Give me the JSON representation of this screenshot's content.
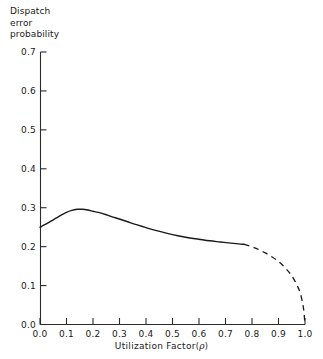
{
  "chart_data": {
    "type": "line",
    "title": "",
    "ylabel": "Dispatch error probability",
    "ylabel_lines": [
      "Dispatch",
      "error",
      "probability"
    ],
    "xlabel": "Utilization Factor (ρ)",
    "xlabel_text": "Utilization  Factor",
    "xlabel_symbol": "ρ",
    "xlabel_paren_open": "(",
    "xlabel_paren_close": ")",
    "xlim": [
      0.0,
      1.0
    ],
    "ylim": [
      0.0,
      0.7
    ],
    "grid": false,
    "legend": null,
    "xticks": [
      0.0,
      0.1,
      0.2,
      0.3,
      0.4,
      0.5,
      0.6,
      0.7,
      0.8,
      0.9,
      1.0
    ],
    "xtick_labels": [
      "0.0",
      "0.1",
      "0.2",
      "0.3",
      "0.4",
      "0.5",
      "0.6",
      "0.7",
      "0.8",
      "0.9",
      "1.0"
    ],
    "yticks": [
      0.0,
      0.1,
      0.2,
      0.3,
      0.4,
      0.5,
      0.6,
      0.7
    ],
    "ytick_labels": [
      "0.0",
      "0.1",
      "0.2",
      "0.3",
      "0.4",
      "0.5",
      "0.6",
      "0.7"
    ],
    "line_color": "#1a1a1a",
    "series": [
      {
        "name": "dispatch-error-probability-solid",
        "style": "solid",
        "x": [
          0.0,
          0.02,
          0.04,
          0.06,
          0.08,
          0.1,
          0.12,
          0.14,
          0.15,
          0.16,
          0.18,
          0.2,
          0.22,
          0.25,
          0.28,
          0.3,
          0.33,
          0.36,
          0.4,
          0.44,
          0.48,
          0.52,
          0.56,
          0.6,
          0.64,
          0.68,
          0.72,
          0.75,
          0.77
        ],
        "y": [
          0.25,
          0.257,
          0.265,
          0.273,
          0.281,
          0.288,
          0.293,
          0.296,
          0.296,
          0.296,
          0.294,
          0.291,
          0.288,
          0.282,
          0.275,
          0.271,
          0.264,
          0.257,
          0.249,
          0.241,
          0.234,
          0.228,
          0.223,
          0.219,
          0.215,
          0.212,
          0.209,
          0.207,
          0.206
        ]
      },
      {
        "name": "dispatch-error-probability-dashed",
        "style": "dashed",
        "x": [
          0.77,
          0.79,
          0.81,
          0.83,
          0.85,
          0.87,
          0.89,
          0.91,
          0.93,
          0.945,
          0.96,
          0.972,
          0.982,
          0.99,
          0.995,
          1.0
        ],
        "y": [
          0.206,
          0.202,
          0.197,
          0.191,
          0.184,
          0.176,
          0.167,
          0.156,
          0.142,
          0.13,
          0.114,
          0.098,
          0.081,
          0.058,
          0.038,
          0.0
        ]
      }
    ],
    "annotations": [
      {
        "name": "solid-dashed-transition",
        "x": 0.77,
        "y": 0.206
      }
    ]
  }
}
